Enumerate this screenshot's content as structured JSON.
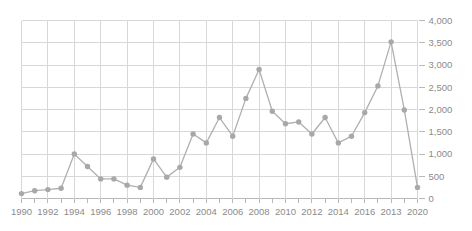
{
  "chart_data": {
    "type": "line",
    "title": "",
    "subtitle": "",
    "xlabel": "",
    "ylabel": "",
    "grid": true,
    "legend": null,
    "legend_position": "none",
    "y_axis_position": "right",
    "ylim": [
      0,
      4000
    ],
    "y_ticks": [
      0,
      500,
      1000,
      1500,
      2000,
      2500,
      3000,
      3500,
      4000
    ],
    "y_tick_labels": [
      "0",
      "500",
      "1,000",
      "1,500",
      "2,000",
      "2,500",
      "3,000",
      "3,500",
      "4,000"
    ],
    "x_tick_labels": [
      "1990",
      "1992",
      "1994",
      "1996",
      "1998",
      "2000",
      "2002",
      "2004",
      "2006",
      "2008",
      "2010",
      "2012",
      "2014",
      "2016",
      "2013",
      "2020"
    ],
    "categories": [
      "1990",
      "1991",
      "1992",
      "1993",
      "1994",
      "1995",
      "1996",
      "1997",
      "1998",
      "1999",
      "2000",
      "2001",
      "2002",
      "2003",
      "2004",
      "2005",
      "2006",
      "2007",
      "2008",
      "2009",
      "2010",
      "2011",
      "2012",
      "2013",
      "2014",
      "2015",
      "2016",
      "2017",
      "2018",
      "2019",
      "2020"
    ],
    "values": [
      110,
      175,
      200,
      230,
      1000,
      720,
      440,
      440,
      300,
      250,
      890,
      480,
      700,
      1450,
      1250,
      1820,
      1400,
      2250,
      2900,
      1960,
      1680,
      1720,
      1450,
      1820,
      1250,
      1400,
      1930,
      2530,
      3520,
      1990,
      250
    ],
    "series_name": "",
    "line_color": "#b0b0b0",
    "marker_color": "#a8a8a8",
    "grid_color": "#d8d8d8",
    "axis_color": "#b8b8b8",
    "label_color": "#8b8b8b"
  }
}
